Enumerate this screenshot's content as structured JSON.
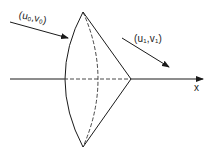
{
  "diagram": {
    "type": "shock-cone-lens",
    "stroke_color": "#1a1a1a",
    "background": "#ffffff",
    "axis": {
      "label": "x"
    },
    "incoming_flow": {
      "label_prefix": "(u",
      "sub_u": "0",
      "mid": ",v",
      "sub_v": "0",
      "suffix": ")"
    },
    "outgoing_flow": {
      "label_prefix": "(u",
      "sub_u": "1",
      "mid": ",v",
      "sub_v": "1",
      "suffix": ")"
    },
    "shape": {
      "top_vertex": [
        83,
        12
      ],
      "bottom_vertex": [
        83,
        147
      ],
      "front_arc_max_x": 65,
      "dashed_arc_max_x": 98,
      "cone_apex": [
        131,
        79
      ]
    }
  }
}
